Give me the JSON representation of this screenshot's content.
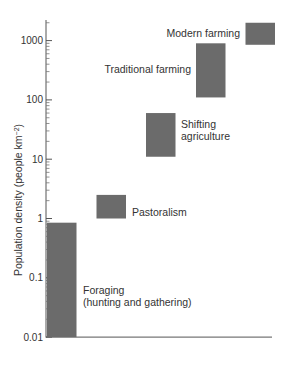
{
  "chart_data": {
    "type": "bar",
    "subtype": "floating-range-bar",
    "title": "",
    "xlabel": "",
    "ylabel": "Population density (people km⁻²)",
    "ylabel_main": "Population density (people km",
    "ylabel_sup": "−2",
    "ylabel_close": ")",
    "yscale": "log",
    "ylim": [
      0.01,
      2000
    ],
    "yticks": [
      0.01,
      0.1,
      1,
      10,
      100,
      1000
    ],
    "ytick_labels": [
      "0.01",
      "0.1",
      "1",
      "10",
      "100",
      "1000"
    ],
    "grid": false,
    "legend": null,
    "bar_color": "#6b6b6b",
    "categories": [
      "Foraging (hunting and gathering)",
      "Pastoralism",
      "Shifting agriculture",
      "Traditional farming",
      "Modern farming"
    ],
    "series": [
      {
        "name": "range_low",
        "values": [
          0.01,
          1,
          11,
          110,
          850
        ]
      },
      {
        "name": "range_high",
        "values": [
          0.85,
          2.5,
          60,
          900,
          2000
        ]
      }
    ],
    "labels": [
      {
        "lines": [
          "Foraging",
          "(hunting and gathering)"
        ]
      },
      {
        "lines": [
          "Pastoralism"
        ]
      },
      {
        "lines": [
          "Shifting",
          "agriculture"
        ]
      },
      {
        "lines": [
          "Traditional farming"
        ]
      },
      {
        "lines": [
          "Modern farming"
        ]
      }
    ]
  }
}
